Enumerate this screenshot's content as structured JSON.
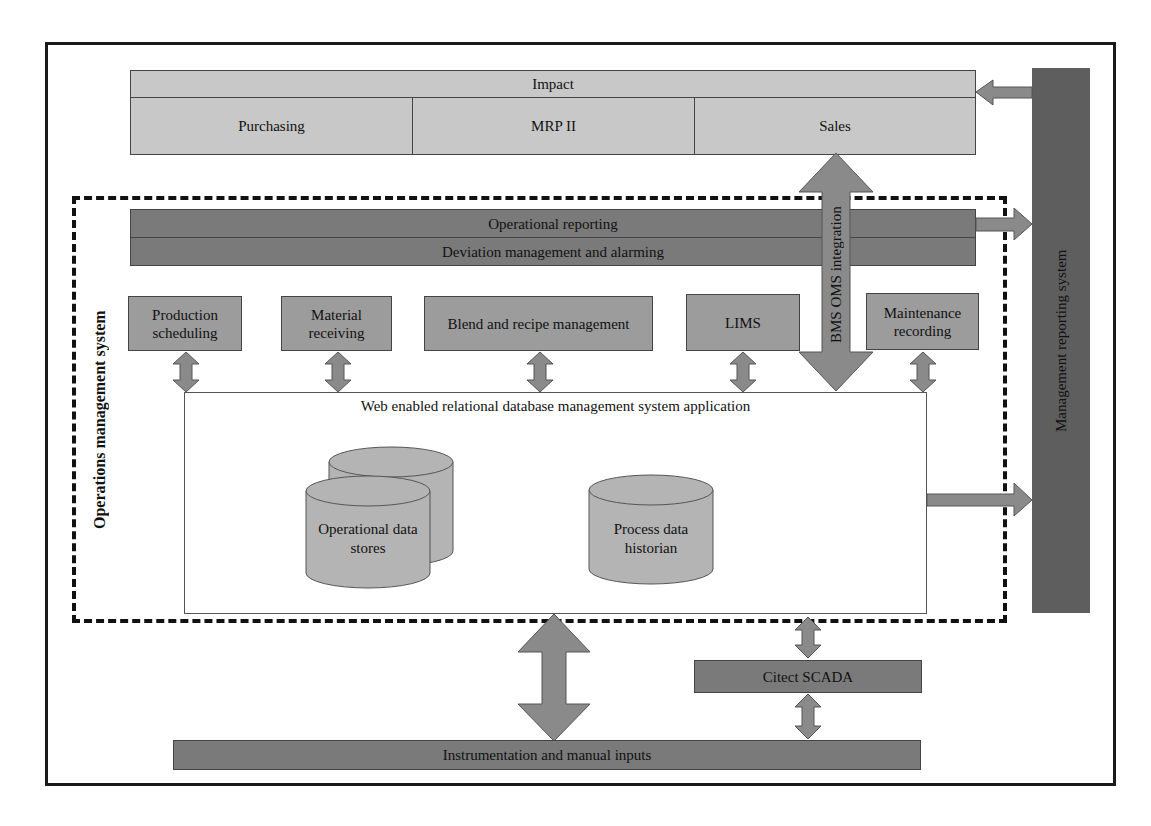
{
  "impact": {
    "title": "Impact",
    "cells": [
      "Purchasing",
      "MRP II",
      "Sales"
    ]
  },
  "management_reporting": {
    "label": "Management reporting system"
  },
  "operations_management": {
    "label": "Operations management system",
    "operational_reporting": "Operational reporting",
    "deviation_management": "Deviation management and alarming",
    "modules": [
      {
        "label": "Production scheduling"
      },
      {
        "label": "Material receiving"
      },
      {
        "label": "Blend and recipe management"
      },
      {
        "label": "LIMS"
      },
      {
        "label": "Maintenance recording"
      }
    ],
    "database_app": {
      "title": "Web enabled relational database management system application",
      "stores": [
        {
          "label": "Operational data stores"
        },
        {
          "label": "Process data historian"
        }
      ]
    }
  },
  "bms_integration": {
    "label": "BMS OMS integration"
  },
  "scada": {
    "label": "Citect SCADA"
  },
  "instrumentation": {
    "label": "Instrumentation and manual inputs"
  },
  "colors": {
    "light_panel": "#c8c8c8",
    "module_panel": "#9c9c9c",
    "band_panel": "#7a7a7a",
    "reporting_bar": "#5e5e5e",
    "arrow_fill": "#8a8a8a",
    "border": "#1a1a1a"
  }
}
